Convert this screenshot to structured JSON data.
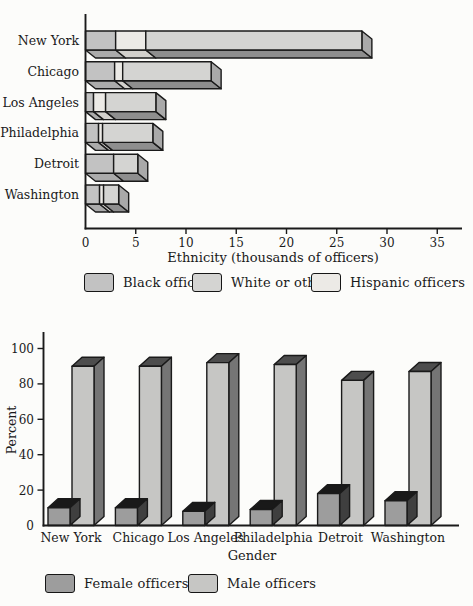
{
  "page": {
    "background": "#fcfcfa",
    "ink": "#1a1a1a"
  },
  "chart_data": [
    {
      "id": "ethnicity",
      "type": "bar",
      "orientation": "horizontal",
      "stacked": true,
      "title": "",
      "xlabel": "Ethnicity (thousands of officers)",
      "ylabel": "",
      "xlim": [
        0,
        37
      ],
      "xticks": [
        0,
        5,
        10,
        15,
        20,
        25,
        30,
        35
      ],
      "grid": false,
      "categories": [
        "New York",
        "Chicago",
        "Los Angeles",
        "Philadelphia",
        "Detroit",
        "Washington"
      ],
      "series": [
        {
          "name": "Black officers",
          "color": "#c2c2c2",
          "shade": "#ababab",
          "values": [
            3.0,
            2.9,
            0.8,
            1.3,
            2.8,
            1.4
          ]
        },
        {
          "name": "Hispanic officers",
          "color": "#eceae6",
          "shade": "#d2d0cc",
          "values": [
            3.0,
            0.8,
            1.2,
            0.4,
            0.0,
            0.4
          ]
        },
        {
          "name": "White or other",
          "color": "#d4d4d2",
          "shade": "#8e8e8e",
          "values": [
            21.5,
            8.8,
            5.0,
            5.0,
            2.4,
            1.5
          ]
        }
      ],
      "totals": [
        27.5,
        12.5,
        7.0,
        6.7,
        5.2,
        3.3
      ],
      "end_face_color": "#a9a9a9",
      "legend_position": "bottom",
      "legend": [
        {
          "label": "Black officers",
          "color": "#c2c2c2"
        },
        {
          "label": "White or other",
          "color": "#d4d4d2"
        },
        {
          "label": "Hispanic officers",
          "color": "#eceae6"
        }
      ]
    },
    {
      "id": "gender",
      "type": "bar",
      "orientation": "vertical",
      "stacked": false,
      "title": "",
      "xlabel": "Gender",
      "ylabel": "Percent",
      "ylim": [
        0,
        100
      ],
      "yticks": [
        0,
        20,
        40,
        60,
        80,
        100
      ],
      "grid": false,
      "categories": [
        "New York",
        "Chicago",
        "Los Angeles",
        "Philadelphia",
        "Detroit",
        "Washington"
      ],
      "series": [
        {
          "name": "Female officers",
          "color": "#9d9d9d",
          "top": "#191919",
          "side": "#3f3f3f",
          "values": [
            10,
            10,
            8,
            9,
            18,
            14
          ]
        },
        {
          "name": "Male officers",
          "color": "#c6c6c4",
          "top": "#4d4d4d",
          "side": "#757575",
          "values": [
            90,
            90,
            92,
            91,
            82,
            87
          ]
        }
      ],
      "legend_position": "bottom",
      "legend": [
        {
          "label": "Female officers",
          "color": "#9d9d9d"
        },
        {
          "label": "Male officers",
          "color": "#c6c6c4"
        }
      ]
    }
  ]
}
